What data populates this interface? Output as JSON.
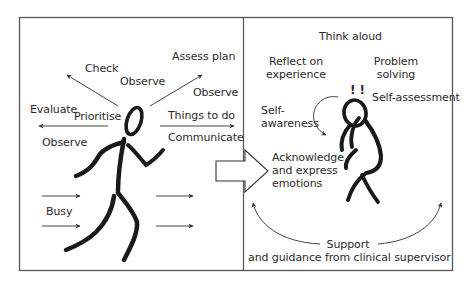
{
  "colors": {
    "frame": "#555555",
    "ink": "#1a1a1a",
    "arrow": "#444444",
    "background": "#ffffff"
  },
  "left_panel": {
    "labels": {
      "check": "Check",
      "observe_top": "Observe",
      "assess_plan": "Assess plan",
      "observe_right": "Observe",
      "evaluate": "Evaluate",
      "prioritise": "Prioritise",
      "things_to_do": "Things to do",
      "communicate": "Communicate",
      "observe_left": "Observe",
      "busy": "Busy"
    },
    "figure": "running-stick-figure"
  },
  "transition": {
    "icon": "block-arrow-right"
  },
  "right_panel": {
    "labels": {
      "think_aloud": "Think aloud",
      "reflect_line1": "Reflect on",
      "reflect_line2": "experience",
      "problem_line1": "Problem",
      "problem_line2": "solving",
      "exclamations": "! !",
      "self_assessment": "Self-assessment",
      "self_awareness_line1": "Self-",
      "self_awareness_line2": "awareness",
      "acknowledge_line1": "Acknowledge",
      "acknowledge_line2": "and express",
      "acknowledge_line3": "emotions",
      "support_line1": "Support",
      "support_line2": "and guidance from clinical supervisor"
    },
    "figure": "thinking-seated-figure"
  }
}
